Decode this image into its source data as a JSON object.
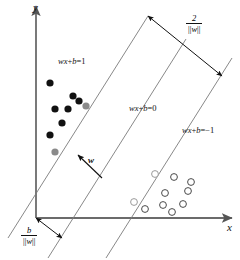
{
  "figure": {
    "background": "#ffffff",
    "width": 240,
    "height": 260
  },
  "axes": {
    "x_label": "x",
    "y_label": "y",
    "color": "#6b6b6b",
    "origin": {
      "x": 36,
      "y": 218
    },
    "x_end": {
      "x": 232,
      "y": 218
    },
    "y_end": {
      "x": 36,
      "y": 6
    }
  },
  "labels": {
    "positive_margin": {
      "text": "wx+b=1",
      "x": 58,
      "y": 57
    },
    "decision_boundary": {
      "text": "wx+b=0",
      "x": 129,
      "y": 104
    },
    "negative_margin": {
      "text": "wx+b=-1",
      "x": 182,
      "y": 126
    },
    "weight_vector": {
      "text": "w",
      "x": 88,
      "y": 156
    }
  },
  "fractions": {
    "margin_width": {
      "numerator": "2",
      "denominator": "||w||",
      "x": 186,
      "y": 14
    },
    "bias_offset": {
      "numerator": "b",
      "denominator": "||w||",
      "x": 21,
      "y": 226
    }
  },
  "lines": {
    "color": "#7a7a7a",
    "positive_boundary": {
      "x1": 8,
      "y1": 238,
      "x2": 148,
      "y2": 16
    },
    "decision_boundary": {
      "x1": 48,
      "y1": 258,
      "x2": 186,
      "y2": 39
    },
    "negative_boundary": {
      "x1": 106,
      "y1": 258,
      "x2": 232,
      "y2": 58
    }
  },
  "margin_arrow": {
    "from": {
      "x": 148,
      "y": 16
    },
    "to": {
      "x": 222,
      "y": 76
    },
    "color": "#111111"
  },
  "bias_arrow": {
    "from": {
      "x": 36,
      "y": 218
    },
    "to": {
      "x": 62,
      "y": 238
    },
    "color": "#111111"
  },
  "weight_arrow": {
    "from": {
      "x": 102,
      "y": 178
    },
    "to": {
      "x": 78,
      "y": 155
    },
    "color": "#111111"
  },
  "chart_data": {
    "type": "scatter",
    "xlabel": "x",
    "ylabel": "y",
    "grid": false,
    "legend": "none",
    "series": [
      {
        "name": "class +1 (filled)",
        "marker": "filled-circle",
        "color": "#111111",
        "radius": 3.6,
        "points": [
          {
            "x": 50,
            "y": 83
          },
          {
            "x": 73,
            "y": 96
          },
          {
            "x": 79,
            "y": 101
          },
          {
            "x": 55,
            "y": 109
          },
          {
            "x": 68,
            "y": 109
          },
          {
            "x": 62,
            "y": 123
          },
          {
            "x": 50,
            "y": 135
          }
        ]
      },
      {
        "name": "class +1 support vectors",
        "marker": "filled-circle",
        "color": "#8a8a8a",
        "radius": 3.6,
        "points": [
          {
            "x": 86,
            "y": 106
          },
          {
            "x": 55,
            "y": 152
          }
        ]
      },
      {
        "name": "class -1 (open)",
        "marker": "open-circle",
        "color": "#4a4a4a",
        "radius": 3.4,
        "points": [
          {
            "x": 174,
            "y": 177
          },
          {
            "x": 191,
            "y": 182
          },
          {
            "x": 165,
            "y": 193
          },
          {
            "x": 188,
            "y": 191
          },
          {
            "x": 163,
            "y": 205
          },
          {
            "x": 183,
            "y": 204
          },
          {
            "x": 172,
            "y": 212
          },
          {
            "x": 145,
            "y": 209
          }
        ]
      },
      {
        "name": "class -1 support vectors",
        "marker": "open-circle",
        "color": "#9a9a9a",
        "radius": 3.4,
        "points": [
          {
            "x": 155,
            "y": 174
          },
          {
            "x": 134,
            "y": 202
          }
        ]
      }
    ]
  }
}
